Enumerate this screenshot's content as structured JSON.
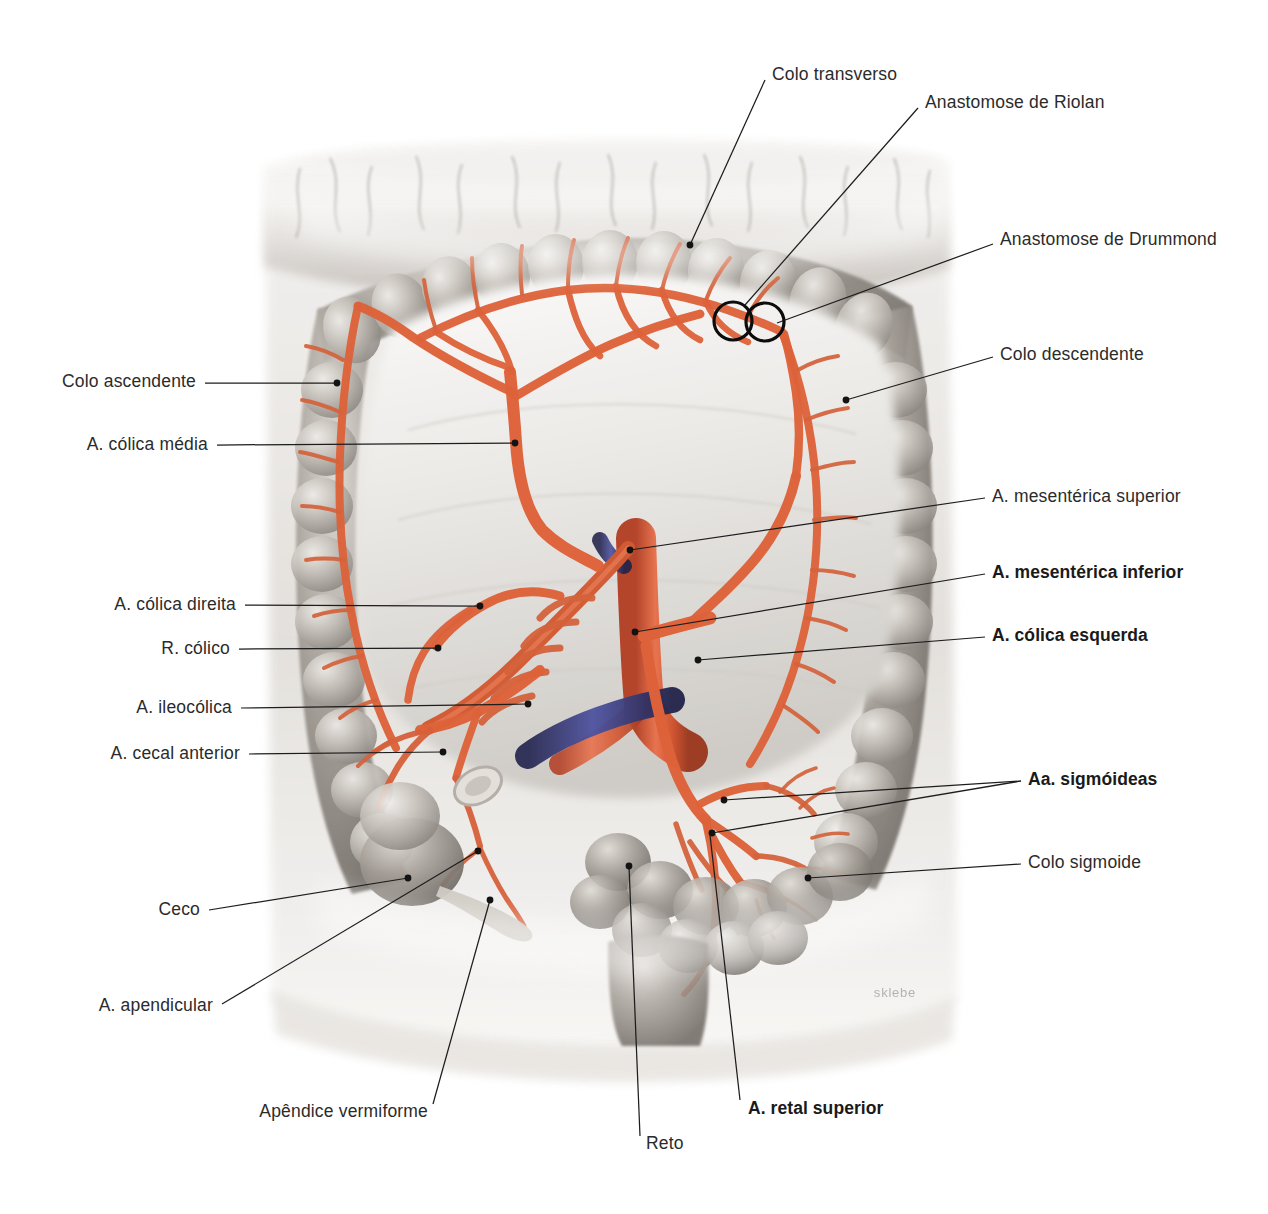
{
  "figure": {
    "signature": "sklebe",
    "background": "#ffffff",
    "artery_color": "#e0603a",
    "artery_shadow": "#b8462a",
    "vein_color": "#4c4f8e",
    "bowel_color": "#9a958e",
    "leader_color": "#1d1d1d",
    "label_color": "#2b2b2b"
  },
  "labels": [
    {
      "id": "colo-transverso",
      "text": "Colo transverso",
      "bold": false,
      "align": "start",
      "text_x": 772,
      "text_y": 74,
      "line": [
        [
          765,
          80
        ],
        [
          690,
          245
        ]
      ],
      "dot": [
        690,
        245
      ]
    },
    {
      "id": "anastomose-riolan",
      "text": "Anastomose de Riolan",
      "bold": false,
      "align": "start",
      "text_x": 925,
      "text_y": 102,
      "line": [
        [
          918,
          108
        ],
        [
          745,
          305
        ]
      ],
      "dot": null
    },
    {
      "id": "anastomose-drummond",
      "text": "Anastomose de Drummond",
      "bold": false,
      "align": "start",
      "text_x": 1000,
      "text_y": 239,
      "line": [
        [
          993,
          244
        ],
        [
          777,
          323
        ]
      ],
      "dot": null
    },
    {
      "id": "colo-descendente",
      "text": "Colo descendente",
      "bold": false,
      "align": "start",
      "text_x": 1000,
      "text_y": 354,
      "line": [
        [
          993,
          357
        ],
        [
          846,
          400
        ]
      ],
      "dot": [
        846,
        400
      ]
    },
    {
      "id": "a-mesenterica-superior",
      "text": "A. mesentérica superior",
      "bold": false,
      "align": "start",
      "text_x": 992,
      "text_y": 496,
      "line": [
        [
          985,
          498
        ],
        [
          630,
          550
        ]
      ],
      "dot": [
        630,
        550
      ]
    },
    {
      "id": "a-mesenterica-inferior",
      "text": "A. mesentérica inferior",
      "bold": true,
      "align": "start",
      "text_x": 992,
      "text_y": 572,
      "line": [
        [
          985,
          574
        ],
        [
          635,
          632
        ]
      ],
      "dot": [
        635,
        632
      ]
    },
    {
      "id": "a-colica-esquerda",
      "text": "A. cólica esquerda",
      "bold": true,
      "align": "start",
      "text_x": 992,
      "text_y": 635,
      "line": [
        [
          985,
          637
        ],
        [
          698,
          660
        ]
      ],
      "dot": [
        698,
        660
      ]
    },
    {
      "id": "aa-sigmoideas",
      "text": "Aa. sigmóideas",
      "bold": true,
      "align": "start",
      "text_x": 1028,
      "text_y": 779,
      "line": [
        [
          1021,
          781
        ],
        [
          724,
          800
        ]
      ],
      "dot": [
        724,
        800
      ]
    },
    {
      "id": "aa-sigmoideas-branch-2",
      "text": "",
      "bold": false,
      "align": "start",
      "text_x": null,
      "text_y": null,
      "line": [
        [
          1021,
          781
        ],
        [
          712,
          833
        ]
      ],
      "dot": [
        712,
        833
      ]
    },
    {
      "id": "colo-sigmoide",
      "text": "Colo sigmoide",
      "bold": false,
      "align": "start",
      "text_x": 1028,
      "text_y": 862,
      "line": [
        [
          1021,
          864
        ],
        [
          808,
          878
        ]
      ],
      "dot": [
        808,
        878
      ]
    },
    {
      "id": "colo-ascendente",
      "text": "Colo ascendente",
      "bold": false,
      "align": "end",
      "text_x": 196,
      "text_y": 381,
      "line": [
        [
          205,
          383
        ],
        [
          337,
          383
        ]
      ],
      "dot": [
        337,
        383
      ]
    },
    {
      "id": "a-colica-media",
      "text": "A. cólica média",
      "bold": false,
      "align": "end",
      "text_x": 208,
      "text_y": 444,
      "line": [
        [
          217,
          445
        ],
        [
          515,
          443
        ]
      ],
      "dot": [
        515,
        443
      ]
    },
    {
      "id": "a-colica-direita",
      "text": "A. cólica direita",
      "bold": false,
      "align": "end",
      "text_x": 236,
      "text_y": 604,
      "line": [
        [
          245,
          605
        ],
        [
          480,
          606
        ]
      ],
      "dot": [
        480,
        606
      ]
    },
    {
      "id": "r-colico",
      "text": "R. cólico",
      "bold": false,
      "align": "end",
      "text_x": 230,
      "text_y": 648,
      "line": [
        [
          239,
          649
        ],
        [
          438,
          648
        ]
      ],
      "dot": [
        438,
        648
      ]
    },
    {
      "id": "a-ileocolica",
      "text": "A. ileocólica",
      "bold": false,
      "align": "end",
      "text_x": 232,
      "text_y": 707,
      "line": [
        [
          241,
          708
        ],
        [
          528,
          704
        ]
      ],
      "dot": [
        528,
        704
      ]
    },
    {
      "id": "a-cecal-anterior",
      "text": "A. cecal anterior",
      "bold": false,
      "align": "end",
      "text_x": 240,
      "text_y": 753,
      "line": [
        [
          249,
          754
        ],
        [
          443,
          752
        ]
      ],
      "dot": [
        443,
        752
      ]
    },
    {
      "id": "ceco",
      "text": "Ceco",
      "bold": false,
      "align": "end",
      "text_x": 200,
      "text_y": 909,
      "line": [
        [
          209,
          910
        ],
        [
          408,
          878
        ]
      ],
      "dot": [
        408,
        878
      ]
    },
    {
      "id": "a-apendicular",
      "text": "A. apendicular",
      "bold": false,
      "align": "end",
      "text_x": 213,
      "text_y": 1005,
      "line": [
        [
          222,
          1004
        ],
        [
          478,
          851
        ]
      ],
      "dot": [
        478,
        851
      ]
    },
    {
      "id": "apendice-vermiforme",
      "text": "Apêndice vermiforme",
      "bold": false,
      "align": "end",
      "text_x": 428,
      "text_y": 1111,
      "line": [
        [
          433,
          1104
        ],
        [
          490,
          900
        ]
      ],
      "dot": [
        490,
        900
      ]
    },
    {
      "id": "reto",
      "text": "Reto",
      "bold": false,
      "align": "start",
      "text_x": 646,
      "text_y": 1143,
      "line": [
        [
          640,
          1136
        ],
        [
          629,
          866
        ]
      ],
      "dot": [
        629,
        866
      ]
    },
    {
      "id": "a-retal-superior",
      "text": "A. retal superior",
      "bold": true,
      "align": "start",
      "text_x": 748,
      "text_y": 1108,
      "line": [
        [
          740,
          1100
        ],
        [
          710,
          835
        ]
      ],
      "dot": null
    }
  ],
  "markers": [
    {
      "id": "marker-riolan",
      "cx": 733,
      "cy": 321,
      "r": 19
    },
    {
      "id": "marker-drummond",
      "cx": 765,
      "cy": 322,
      "r": 19
    }
  ]
}
